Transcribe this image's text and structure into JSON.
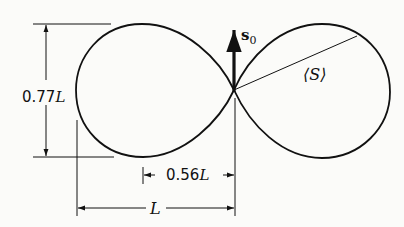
{
  "diagram": {
    "labels": {
      "height_value": "0.77",
      "height_unit": "L",
      "length_unit": "L",
      "offset_value": "0.56",
      "offset_unit": "L",
      "vector_symbol": "s",
      "vector_subscript": "0",
      "mean_label": "⟨S⟩"
    },
    "colors": {
      "stroke": "#111111",
      "background": "#fbfbf9"
    }
  }
}
